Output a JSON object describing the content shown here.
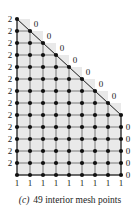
{
  "figure": {
    "caption_tag": "(c)",
    "caption_text": "49 interior mesh points",
    "interior_point_count": 49
  },
  "colors": {
    "line": "#6b6b6b",
    "node": "#111111",
    "hypotenuse": "#1a1a1a",
    "fill": "#e9e9e9",
    "text": "#1a1a1a",
    "background": "#ffffff"
  },
  "chart_data": {
    "type": "diagram",
    "title": "49 interior mesh points",
    "grid": {
      "columns": 9,
      "rows": 14,
      "spacing_x": 13,
      "spacing_y": 12,
      "origin_x": 17,
      "origin_y": 19
    },
    "row_widths": [
      1,
      2,
      3,
      4,
      5,
      6,
      7,
      8,
      9,
      9,
      9,
      9,
      9,
      9
    ],
    "boundary_labels": {
      "left_edge_value": "2",
      "bottom_edge_value": "1",
      "diagonal_edge_value": "0",
      "right_edge_value": "0"
    },
    "left_labels": [
      "2",
      "2",
      "2",
      "2",
      "2",
      "2",
      "2",
      "2",
      "2",
      "2",
      "2",
      "2",
      "2"
    ],
    "bottom_labels": [
      "1",
      "1",
      "1",
      "1",
      "1",
      "1",
      "1",
      "1",
      "1"
    ],
    "diagonal_labels": [
      "0",
      "0",
      "0",
      "0",
      "0",
      "0",
      "0"
    ],
    "right_labels": [
      "0",
      "0",
      "0",
      "0",
      "0"
    ]
  }
}
